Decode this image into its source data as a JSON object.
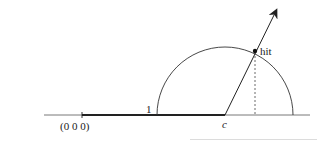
{
  "diagram": {
    "title": "",
    "labels": {
      "origin": "(0 0 0)",
      "unit": "1",
      "center": "c",
      "hit": "hit"
    },
    "colors": {
      "line": "#333333",
      "thin_axis": "#555555",
      "background": "#ffffff"
    }
  }
}
